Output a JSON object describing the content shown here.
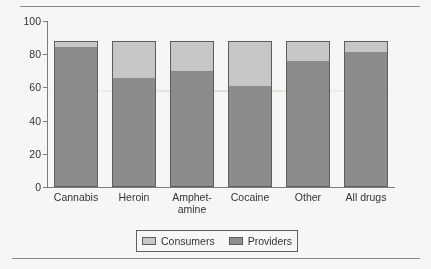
{
  "chart_data": {
    "type": "bar",
    "subtype": "stacked-bar",
    "title": "",
    "xlabel": "",
    "ylabel": "",
    "ylim": [
      0,
      100
    ],
    "yticks": [
      0,
      20,
      40,
      60,
      80,
      100
    ],
    "ytick_labels": [
      "0",
      "20",
      "40",
      "60",
      "80",
      "100"
    ],
    "grid": false,
    "legend_position": "bottom-center",
    "categories": [
      "Cannabis",
      "Heroin",
      "Amphet-amine",
      "Cocaine",
      "Other",
      "All drugs"
    ],
    "category_lines": [
      [
        "Cannabis"
      ],
      [
        "Heroin"
      ],
      [
        "Amphet-",
        "amine"
      ],
      [
        "Cocaine"
      ],
      [
        "Other"
      ],
      [
        "All drugs"
      ]
    ],
    "series": [
      {
        "name": "Providers",
        "color": "#8e8e8e",
        "values": [
          84,
          65,
          69,
          60,
          75.5,
          80.5
        ]
      },
      {
        "name": "Consumers",
        "color": "#cdcdcd",
        "values": [
          4,
          23,
          19,
          28,
          12.5,
          7.5
        ]
      }
    ],
    "stack_totals": [
      88,
      88,
      88,
      88,
      88,
      88
    ],
    "legend": [
      "Consumers",
      "Providers"
    ]
  },
  "legend": {
    "items": [
      {
        "label": "Consumers",
        "color": "#cdcdcd"
      },
      {
        "label": "Providers",
        "color": "#8e8e8e"
      }
    ]
  },
  "colors": {
    "consumers": "#cdcdcd",
    "providers": "#8e8e8e",
    "axis": "#7d7d7d",
    "text": "#2e2e2e",
    "rule": "#8a8a8a",
    "background": "#fefefe"
  }
}
